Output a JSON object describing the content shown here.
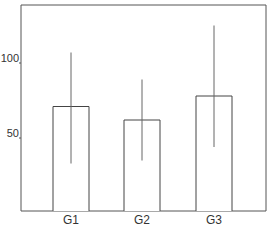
{
  "chart_data": {
    "type": "bar",
    "title": "",
    "xlabel": "",
    "ylabel": "",
    "categories": [
      "G1",
      "G2",
      "G3"
    ],
    "values": [
      71,
      62,
      78
    ],
    "error_bars": {
      "lower": [
        33,
        35,
        44
      ],
      "upper": [
        107,
        89,
        125
      ]
    },
    "ylim": [
      0,
      140
    ],
    "yticks": [
      50,
      100
    ],
    "ytick_labels": [
      "50",
      "100"
    ],
    "grid": false,
    "legend": null,
    "bar_fill": "#ffffff",
    "line_color": "#444444"
  }
}
